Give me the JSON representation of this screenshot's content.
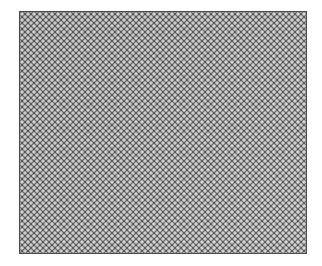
{
  "image": {
    "description": "Dark gray panel covered with a regular offset grid of light gray dots (perforated/mesh texture)",
    "background_color": "#ffffff",
    "panel": {
      "color": "#595959",
      "dot_color": "#d8d8d8",
      "dot_spacing_px": 6,
      "pattern": "offset-dot-grid"
    }
  }
}
